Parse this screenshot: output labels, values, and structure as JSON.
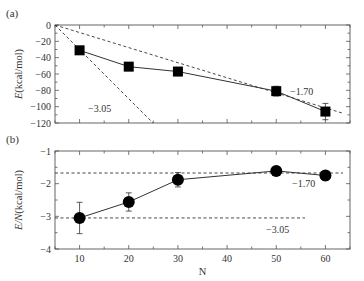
{
  "chart_data": [
    {
      "panel": "(a)",
      "type": "line",
      "title": "",
      "xlabel": "N",
      "ylabel": "E(kcal/mol)",
      "xlim": [
        5,
        65
      ],
      "ylim": [
        -120,
        0
      ],
      "yticks": [
        0,
        -20,
        -40,
        -60,
        -80,
        -100,
        -120
      ],
      "ytick_labels": [
        "0",
        "−20",
        "−40",
        "−60",
        "−80",
        "−100",
        "−120"
      ],
      "xticks": [
        10,
        20,
        30,
        40,
        50,
        60
      ],
      "grid": false,
      "series": [
        {
          "name": "E",
          "marker": "square",
          "x": [
            10,
            20,
            30,
            50,
            60
          ],
          "values": [
            -31,
            -51,
            -57,
            -81,
            -106
          ],
          "error": [
            3,
            3,
            5,
            6,
            10
          ]
        }
      ],
      "reference_lines": [
        {
          "label": "−3.05",
          "style": "dashed",
          "slope_per_N": -3.05
        },
        {
          "label": "−1.70",
          "style": "dashed",
          "slope_per_N": -1.7
        }
      ]
    },
    {
      "panel": "(b)",
      "type": "line",
      "title": "",
      "xlabel": "N",
      "ylabel": "E/N(kcal/mol)",
      "xlim": [
        5,
        65
      ],
      "ylim": [
        -4,
        -1
      ],
      "yticks": [
        -1,
        -2,
        -3,
        -4
      ],
      "ytick_labels": [
        "−1",
        "−2",
        "−3",
        "−4"
      ],
      "xticks": [
        10,
        20,
        30,
        40,
        50,
        60
      ],
      "xtick_labels": [
        "10",
        "20",
        "30",
        "40",
        "50",
        "60"
      ],
      "grid": false,
      "series": [
        {
          "name": "E/N",
          "marker": "circle",
          "x": [
            10,
            20,
            30,
            50,
            60
          ],
          "values": [
            -3.05,
            -2.56,
            -1.88,
            -1.61,
            -1.75
          ],
          "error": [
            0.48,
            0.28,
            0.22,
            0.12,
            0.15
          ]
        }
      ],
      "reference_lines": [
        {
          "label": "−1.70",
          "style": "dashed",
          "y": -1.7
        },
        {
          "label": "−3.05",
          "style": "dashed",
          "y": -3.05
        }
      ]
    }
  ],
  "labels": {
    "panel_a": "(a)",
    "panel_b": "(b)",
    "ylabel_a": "E(kcal/mol)",
    "ylabel_b": "E/N(kcal/mol)",
    "xlabel": "N",
    "annot_a_steep": "−3.05",
    "annot_a_shallow": "−1.70",
    "annot_b_top": "−1.70",
    "annot_b_bottom": "−3.05"
  },
  "colors": {
    "line": "#333333",
    "marker": "#000000",
    "axis": "#555555"
  }
}
